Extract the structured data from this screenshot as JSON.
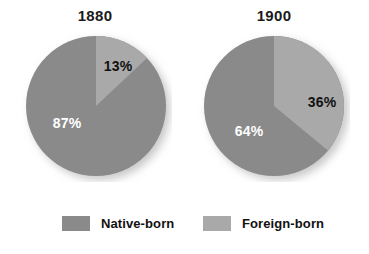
{
  "chart_data": {
    "type": "pie",
    "title": "",
    "charts": [
      {
        "title": "1880",
        "categories": [
          "Native-born",
          "Foreign-born"
        ],
        "values": [
          87,
          13
        ],
        "labels": [
          "87%",
          "13%"
        ],
        "start_angle_deg": 0,
        "direction": "clockwise"
      },
      {
        "title": "1900",
        "categories": [
          "Native-born",
          "Foreign-born"
        ],
        "values": [
          64,
          36
        ],
        "labels": [
          "64%",
          "36%"
        ],
        "start_angle_deg": 0,
        "direction": "clockwise"
      }
    ],
    "legend": {
      "position": "bottom",
      "entries": [
        {
          "label": "Native-born",
          "color": "#8a8a8a"
        },
        {
          "label": "Foreign-born",
          "color": "#a9a9a9"
        }
      ]
    },
    "colors": {
      "native_born": "#8a8a8a",
      "foreign_born": "#a9a9a9",
      "background": "#ffffff",
      "label_dark": "#111111",
      "label_light": "#ffffff"
    },
    "grid": false
  },
  "charts": {
    "chart1": {
      "title": "1880",
      "native_label": "87%",
      "foreign_label": "13%"
    },
    "chart2": {
      "title": "1900",
      "native_label": "64%",
      "foreign_label": "36%"
    }
  },
  "legend": {
    "native_label": "Native-born",
    "foreign_label": "Foreign-born"
  }
}
